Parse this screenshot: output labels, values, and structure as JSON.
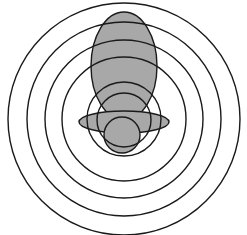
{
  "figure": {
    "canvas": {
      "width": 247,
      "height": 235
    },
    "background_color": "#ffffff",
    "stroke_color": "#1a1a1a",
    "fill_gray": "#a8a8a8",
    "stroke_width": 1.4,
    "center": {
      "x": 124,
      "y": 119
    },
    "concentric_circles": [
      {
        "name": "ring-1-outer",
        "cx": 124,
        "cy": 119,
        "r": 116,
        "fill": "none"
      },
      {
        "name": "ring-2",
        "cx": 124,
        "cy": 119,
        "r": 97,
        "fill": "none"
      },
      {
        "name": "ring-3",
        "cx": 124,
        "cy": 119,
        "r": 79,
        "fill": "none"
      },
      {
        "name": "ring-4-inner",
        "cx": 124,
        "cy": 119,
        "r": 62,
        "fill": "none"
      },
      {
        "name": "ring-5-core",
        "cx": 124,
        "cy": 119,
        "r": 37,
        "fill": "none"
      }
    ],
    "shaded_shapes": [
      {
        "name": "tall-vertical-ellipse",
        "type": "ellipse",
        "cx": 124,
        "cy": 66,
        "rx": 33,
        "ry": 54,
        "fill": "#a8a8a8"
      },
      {
        "name": "medium-circle",
        "type": "circle",
        "cx": 124,
        "cy": 120,
        "r": 27,
        "fill": "#a8a8a8"
      },
      {
        "name": "flat-horizontal-ellipse",
        "type": "ellipse",
        "cx": 124,
        "cy": 122,
        "rx": 45,
        "ry": 11,
        "fill": "#a8a8a8"
      },
      {
        "name": "small-bottom-circle",
        "type": "circle",
        "cx": 122,
        "cy": 135,
        "r": 18,
        "fill": "#a8a8a8"
      }
    ]
  }
}
